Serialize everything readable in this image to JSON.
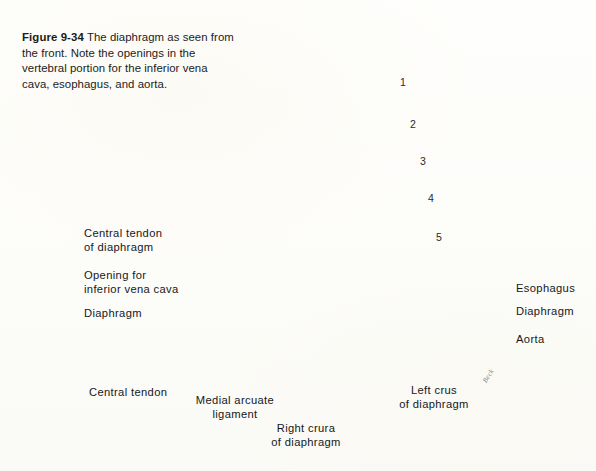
{
  "figure": {
    "number_label": "Figure 9-34",
    "caption_text": "  The diaphragm as seen from the front. Note the openings in the vertebral portion for the inferior vena cava, esophagus, and aorta."
  },
  "labels": {
    "central_tendon_of_diaphragm": "Central tendon\nof diaphragm",
    "opening_for_ivc": "Opening for\ninferior vena cava",
    "diaphragm_left": "Diaphragm",
    "central_tendon": "Central tendon",
    "medial_arcuate_ligament": "Medial arcuate\nligament",
    "right_crura_of_diaphragm": "Right crura\nof diaphragm",
    "left_crus_of_diaphragm": "Left crus\nof diaphragm",
    "esophagus": "Esophagus",
    "diaphragm_right": "Diaphragm",
    "aorta": "Aorta"
  },
  "rib_numbers": [
    "1",
    "2",
    "3",
    "4",
    "5"
  ],
  "signature": "Beck",
  "colors": {
    "page_background": "#fdfdfb",
    "text": "#16181a",
    "leader_line": "#16181a",
    "bone_light": "#f2f1ee",
    "bone_shade": "#b9b8b4",
    "muscle_dark": "#4a4845",
    "muscle_mid": "#8a8783",
    "tendon_light": "#e3e1dc",
    "outline": "#1d1d1b"
  }
}
